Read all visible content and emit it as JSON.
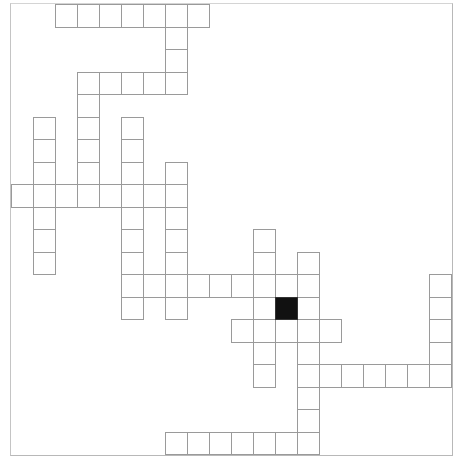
{
  "puzzle": {
    "type": "crossword",
    "cell_size": {
      "width": 22,
      "height": 22.5
    },
    "origin": {
      "x": 11,
      "y": 4
    },
    "colors": {
      "line": "#9a9a9a",
      "block": "#111111",
      "background": "#ffffff",
      "frame": "#b8b8b8"
    },
    "entries": [
      {
        "dir": "across",
        "row": 0,
        "col": 2,
        "length": 7
      },
      {
        "dir": "down",
        "row": 0,
        "col": 7,
        "length": 4
      },
      {
        "dir": "across",
        "row": 3,
        "col": 3,
        "length": 5
      },
      {
        "dir": "down",
        "row": 3,
        "col": 3,
        "length": 6
      },
      {
        "dir": "down",
        "row": 5,
        "col": 1,
        "length": 7
      },
      {
        "dir": "down",
        "row": 5,
        "col": 5,
        "length": 9
      },
      {
        "dir": "down",
        "row": 7,
        "col": 7,
        "length": 7
      },
      {
        "dir": "across",
        "row": 8,
        "col": 0,
        "length": 8
      },
      {
        "dir": "across",
        "row": 12,
        "col": 5,
        "length": 9
      },
      {
        "dir": "down",
        "row": 10,
        "col": 11,
        "length": 7
      },
      {
        "dir": "down",
        "row": 11,
        "col": 13,
        "length": 9
      },
      {
        "dir": "across",
        "row": 14,
        "col": 10,
        "length": 5
      },
      {
        "dir": "across",
        "row": 16,
        "col": 13,
        "length": 7
      },
      {
        "dir": "down",
        "row": 12,
        "col": 19,
        "length": 5
      },
      {
        "dir": "across",
        "row": 19,
        "col": 7,
        "length": 7
      }
    ],
    "blocks": [
      {
        "row": 13,
        "col": 12
      }
    ]
  }
}
